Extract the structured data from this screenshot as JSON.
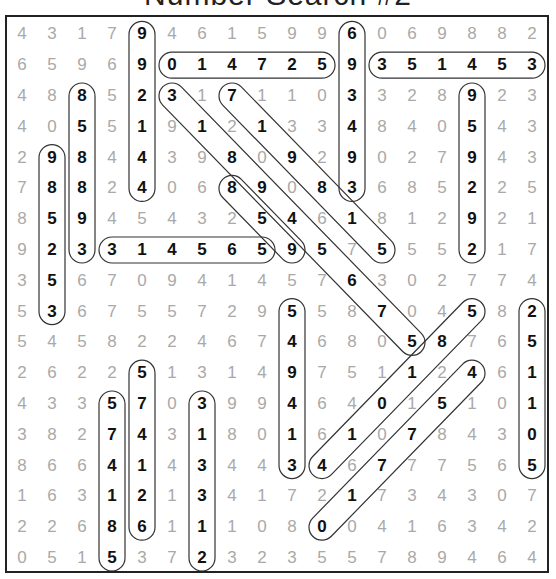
{
  "title": "Number Search #2",
  "grid": [
    [
      4,
      3,
      1,
      7,
      9,
      4,
      6,
      1,
      5,
      9,
      9,
      6,
      0,
      6,
      9,
      8,
      8,
      2
    ],
    [
      6,
      5,
      9,
      6,
      9,
      0,
      1,
      4,
      7,
      2,
      5,
      9,
      3,
      5,
      1,
      4,
      5,
      3
    ],
    [
      4,
      8,
      8,
      5,
      2,
      3,
      1,
      7,
      1,
      1,
      0,
      3,
      3,
      2,
      8,
      9,
      2,
      3
    ],
    [
      4,
      0,
      5,
      5,
      1,
      9,
      1,
      2,
      1,
      3,
      3,
      4,
      8,
      4,
      0,
      5,
      4,
      3
    ],
    [
      2,
      9,
      8,
      4,
      4,
      3,
      9,
      8,
      0,
      9,
      2,
      9,
      0,
      2,
      7,
      9,
      4,
      3
    ],
    [
      7,
      8,
      8,
      2,
      4,
      0,
      6,
      8,
      9,
      0,
      8,
      3,
      6,
      8,
      5,
      2,
      2,
      5
    ],
    [
      8,
      5,
      9,
      4,
      5,
      4,
      3,
      2,
      5,
      4,
      6,
      1,
      8,
      1,
      2,
      9,
      2,
      1
    ],
    [
      9,
      2,
      3,
      3,
      1,
      4,
      5,
      6,
      5,
      9,
      5,
      7,
      5,
      5,
      5,
      2,
      1,
      7
    ],
    [
      3,
      5,
      6,
      7,
      0,
      9,
      4,
      1,
      4,
      5,
      7,
      6,
      3,
      0,
      2,
      7,
      7,
      4
    ],
    [
      5,
      3,
      6,
      7,
      5,
      5,
      7,
      2,
      9,
      5,
      5,
      8,
      7,
      0,
      4,
      5,
      8,
      2
    ],
    [
      5,
      4,
      5,
      8,
      2,
      2,
      4,
      6,
      7,
      4,
      6,
      8,
      0,
      5,
      8,
      7,
      6,
      5
    ],
    [
      2,
      6,
      2,
      2,
      5,
      1,
      3,
      1,
      4,
      9,
      7,
      5,
      1,
      1,
      2,
      4,
      6,
      1
    ],
    [
      4,
      3,
      3,
      5,
      7,
      0,
      3,
      9,
      9,
      4,
      6,
      4,
      0,
      1,
      5,
      1,
      0,
      1
    ],
    [
      3,
      8,
      2,
      7,
      4,
      3,
      1,
      8,
      0,
      1,
      6,
      1,
      0,
      7,
      8,
      4,
      3,
      0
    ],
    [
      8,
      6,
      6,
      4,
      1,
      4,
      3,
      4,
      4,
      3,
      4,
      6,
      7,
      7,
      7,
      5,
      6,
      5
    ],
    [
      1,
      6,
      3,
      1,
      2,
      1,
      3,
      4,
      1,
      7,
      2,
      1,
      7,
      3,
      4,
      3,
      0,
      7
    ],
    [
      2,
      2,
      6,
      8,
      6,
      1,
      1,
      1,
      0,
      8,
      0,
      0,
      4,
      1,
      6,
      3,
      4,
      2
    ],
    [
      0,
      5,
      1,
      5,
      3,
      7,
      2,
      3,
      2,
      3,
      5,
      5,
      7,
      8,
      9,
      4,
      6,
      4
    ]
  ],
  "found_numbers": [
    {
      "digits": "992144",
      "start": [
        0,
        4
      ],
      "end": [
        5,
        4
      ]
    },
    {
      "digits": "693493",
      "start": [
        0,
        11
      ],
      "end": [
        5,
        11
      ]
    },
    {
      "digits": "014725",
      "start": [
        1,
        5
      ],
      "end": [
        1,
        10
      ]
    },
    {
      "digits": "351453",
      "start": [
        1,
        12
      ],
      "end": [
        1,
        17
      ]
    },
    {
      "digits": "858893",
      "start": [
        2,
        2
      ],
      "end": [
        7,
        2
      ]
    },
    {
      "digits": "959292",
      "start": [
        2,
        15
      ],
      "end": [
        7,
        15
      ]
    },
    {
      "digits": "318945780",
      "start": [
        2,
        5
      ],
      "end": [
        10,
        13
      ]
    },
    {
      "digits": "719815",
      "start": [
        2,
        7
      ],
      "end": [
        7,
        12
      ]
    },
    {
      "digits": "859",
      "start": [
        5,
        7
      ],
      "end": [
        7,
        9
      ]
    },
    {
      "digits": "985253",
      "start": [
        4,
        1
      ],
      "end": [
        9,
        1
      ]
    },
    {
      "digits": "314565",
      "start": [
        7,
        3
      ],
      "end": [
        7,
        8
      ]
    },
    {
      "digits": "549413",
      "start": [
        9,
        9
      ],
      "end": [
        14,
        9
      ]
    },
    {
      "digits": "251105",
      "start": [
        9,
        17
      ],
      "end": [
        14,
        17
      ]
    },
    {
      "digits": "581014",
      "start": [
        9,
        15
      ],
      "end": [
        14,
        10
      ]
    },
    {
      "digits": "457710",
      "start": [
        11,
        15
      ],
      "end": [
        16,
        10
      ]
    },
    {
      "digits": "574126",
      "start": [
        11,
        4
      ],
      "end": [
        16,
        4
      ]
    },
    {
      "digits": "574185",
      "start": [
        12,
        3
      ],
      "end": [
        17,
        3
      ]
    },
    {
      "digits": "313312",
      "start": [
        12,
        6
      ],
      "end": [
        17,
        6
      ]
    }
  ]
}
